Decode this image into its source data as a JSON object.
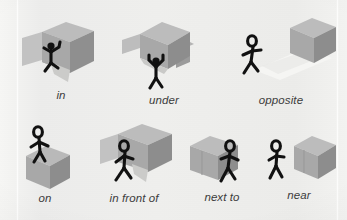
{
  "figure": {
    "background_color": "#efefed",
    "label_color": "#3c3c3c",
    "cube_colors": {
      "top": "#b9b9b9",
      "left": "#a6a6a6",
      "right": "#8f8f8f",
      "panel": "#c2c2c2",
      "interior": "#cfcfcf",
      "shadow": "#d8d8d6",
      "highlight": "#f2f2f0"
    },
    "figure_color": "#111111",
    "rows": [
      {
        "row_index": 0,
        "cells": [
          {
            "label": "in",
            "relation": "figure inside open cube",
            "label_x": 61,
            "label_y": 89
          },
          {
            "label": "under",
            "relation": "figure beneath elevated cube",
            "label_x": 164,
            "label_y": 94
          },
          {
            "label": "opposite",
            "relation": "figure facing cube across a path",
            "label_x": 281,
            "label_y": 90
          }
        ]
      },
      {
        "row_index": 1,
        "cells": [
          {
            "label": "on",
            "relation": "figure standing on top of cube",
            "label_x": 45,
            "label_y": 199
          },
          {
            "label": "in front of",
            "relation": "figure in front of cube",
            "label_x": 134,
            "label_y": 199
          },
          {
            "label": "next to",
            "relation": "figure beside and touching cube",
            "label_x": 222,
            "label_y": 198
          },
          {
            "label": "near",
            "relation": "figure at a small distance from cube",
            "label_x": 299,
            "label_y": 196
          }
        ]
      }
    ]
  }
}
